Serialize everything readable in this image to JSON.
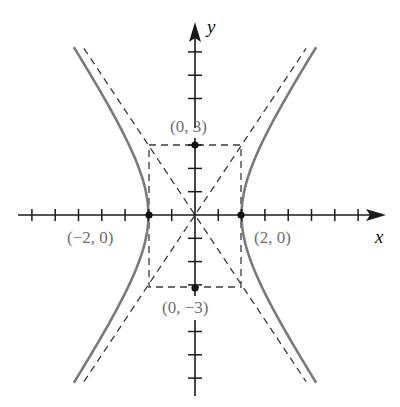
{
  "figure": {
    "type": "hyperbola-graph",
    "equation_implied": "x^2/4 - y^2/9 = 1",
    "axes": {
      "x_label": "x",
      "y_label": "y",
      "origin_px": [
        195,
        215
      ],
      "unit_px": 23.3,
      "x_ticks": [
        -7,
        -6,
        -5,
        -4,
        -3,
        -2,
        -1,
        1,
        2,
        3,
        4,
        5,
        6,
        7
      ],
      "y_ticks_up": [
        1,
        2,
        3,
        5,
        6,
        7
      ],
      "y_ticks_down": [
        -1,
        -2,
        -3,
        -5,
        -6,
        -7
      ]
    },
    "points": [
      {
        "label": "(0, 3)",
        "x": 0,
        "y": 3
      },
      {
        "label": "(0, −3)",
        "x": 0,
        "y": -3
      },
      {
        "label": "(−2, 0)",
        "x": -2,
        "y": 0
      },
      {
        "label": "(2, 0)",
        "x": 2,
        "y": 0
      }
    ],
    "asymptotes": [
      "y = 1.5x",
      "y = -1.5x"
    ],
    "central_box": {
      "x": [
        -2,
        2
      ],
      "y": [
        -3,
        3
      ]
    },
    "colors": {
      "curve": "#7a7a7a",
      "axis": "#1a1a1a",
      "dashed": "#3a3a3a",
      "label": "#6e6e6e"
    }
  },
  "chart_data": {
    "type": "line",
    "title": "",
    "xlabel": "x",
    "ylabel": "y",
    "xlim": [
      -8,
      8
    ],
    "ylim": [
      -8,
      8
    ],
    "grid": false,
    "series": [
      {
        "name": "hyperbola right branch",
        "style": "solid",
        "equation": "x = 2*sqrt(1 + y^2/9)"
      },
      {
        "name": "hyperbola left branch",
        "style": "solid",
        "equation": "x = -2*sqrt(1 + y^2/9)"
      },
      {
        "name": "asymptote",
        "style": "dashed",
        "equation": "y = 1.5x"
      },
      {
        "name": "asymptote",
        "style": "dashed",
        "equation": "y = -1.5x"
      }
    ],
    "annotations": [
      "(0, 3)",
      "(0, −3)",
      "(−2, 0)",
      "(2, 0)"
    ]
  },
  "labels": {
    "x_axis": "x",
    "y_axis": "y",
    "top_point": "(0, 3)",
    "bottom_point": "(0, −3)",
    "left_vertex": "(−2, 0)",
    "right_vertex": "(2, 0)"
  }
}
